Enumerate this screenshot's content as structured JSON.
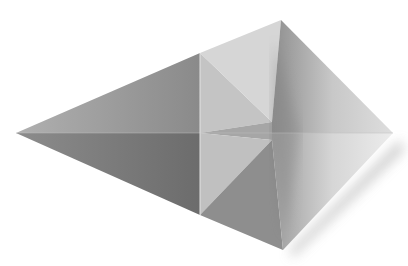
{
  "image": {
    "subject": "Folded origami paper shape (kite-shaped fold) photographed on white background",
    "background_color": "#ffffff",
    "facets": [
      {
        "name": "left-upper-facet",
        "color": "#a0a0a0"
      },
      {
        "name": "left-lower-facet",
        "color": "#7a7a7a"
      },
      {
        "name": "center-upper-left-facet",
        "color": "#c6c6c6"
      },
      {
        "name": "center-upper-right-facet",
        "color": "#d8d8d8"
      },
      {
        "name": "right-upper-facet",
        "color": "#b4b4b4"
      },
      {
        "name": "center-lower-left-facet",
        "color": "#c0c0c0"
      },
      {
        "name": "center-lower-right-facet",
        "color": "#8e8e8e"
      },
      {
        "name": "right-lower-facet",
        "color": "#cfcfcf"
      }
    ],
    "shadow_color": "#9a9a9a"
  }
}
